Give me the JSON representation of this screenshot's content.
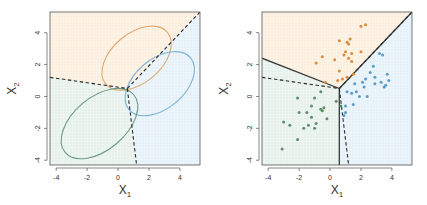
{
  "chart_data": [
    {
      "type": "scatter",
      "panel": "left",
      "title": "",
      "xlabel": "X1",
      "ylabel": "X2",
      "xlim": [
        -4.4,
        5.3
      ],
      "ylim": [
        -4.3,
        5.3
      ],
      "xticks": [
        -4,
        -2,
        0,
        2,
        4
      ],
      "yticks": [
        -4,
        -2,
        0,
        2,
        4
      ],
      "xtick_labels": [
        "-4",
        "-2",
        "0",
        "2",
        "4"
      ],
      "ytick_labels": [
        "-4",
        "-2",
        "0",
        "2",
        "4"
      ],
      "grid": true,
      "regions": [
        {
          "name": "orange-region",
          "color": "#fbeedd",
          "polygon": [
            [
              -4.4,
              1.2
            ],
            [
              0.6,
              0.5
            ],
            [
              5.3,
              5.3
            ],
            [
              -4.4,
              5.3
            ]
          ]
        },
        {
          "name": "blue-region",
          "color": "#e4f1f8",
          "polygon": [
            [
              0.6,
              0.5
            ],
            [
              5.3,
              5.3
            ],
            [
              5.3,
              -4.3
            ],
            [
              1.2,
              -4.3
            ]
          ]
        },
        {
          "name": "green-region",
          "color": "#e6f1ec",
          "polygon": [
            [
              -4.4,
              1.2
            ],
            [
              0.6,
              0.5
            ],
            [
              1.2,
              -4.3
            ],
            [
              -4.4,
              -4.3
            ]
          ]
        }
      ],
      "ellipses": [
        {
          "name": "orange-class",
          "color": "#e3a66b",
          "cx": 1.2,
          "cy": 2.4,
          "rx": 2.6,
          "ry": 1.55,
          "angle": -40
        },
        {
          "name": "blue-class",
          "color": "#7fb2d6",
          "cx": 2.7,
          "cy": 0.8,
          "rx": 2.6,
          "ry": 1.55,
          "angle": -40
        },
        {
          "name": "green-class",
          "color": "#6c9a7e",
          "cx": -1.2,
          "cy": -1.7,
          "rx": 2.9,
          "ry": 1.65,
          "angle": -40
        }
      ],
      "bayes_boundary_dashed": [
        [
          [
            -4.4,
            1.2
          ],
          [
            0.6,
            0.5
          ]
        ],
        [
          [
            0.6,
            0.5
          ],
          [
            5.3,
            5.3
          ]
        ],
        [
          [
            0.6,
            0.5
          ],
          [
            1.2,
            -4.3
          ]
        ]
      ]
    },
    {
      "type": "scatter",
      "panel": "right",
      "title": "",
      "xlabel": "X1",
      "ylabel": "X2",
      "xlim": [
        -4.4,
        5.3
      ],
      "ylim": [
        -4.3,
        5.3
      ],
      "xticks": [
        -4,
        -2,
        0,
        2,
        4
      ],
      "yticks": [
        -4,
        -2,
        0,
        2,
        4
      ],
      "xtick_labels": [
        "-4",
        "-2",
        "0",
        "2",
        "4"
      ],
      "ytick_labels": [
        "-4",
        "-2",
        "0",
        "2",
        "4"
      ],
      "grid": true,
      "regions": [
        {
          "name": "orange-region",
          "color": "#fbeedd",
          "polygon": [
            [
              -4.4,
              2.4
            ],
            [
              0.6,
              0.5
            ],
            [
              5.3,
              5.3
            ],
            [
              -4.4,
              5.3
            ]
          ]
        },
        {
          "name": "blue-region",
          "color": "#e4f1f8",
          "polygon": [
            [
              0.6,
              0.5
            ],
            [
              5.3,
              5.3
            ],
            [
              5.3,
              -4.3
            ],
            [
              0.6,
              -4.3
            ]
          ]
        },
        {
          "name": "green-region",
          "color": "#e6f1ec",
          "polygon": [
            [
              -4.4,
              2.4
            ],
            [
              0.6,
              0.5
            ],
            [
              0.6,
              -4.3
            ],
            [
              -4.4,
              -4.3
            ]
          ]
        }
      ],
      "lda_boundary_solid": [
        [
          [
            -4.4,
            2.4
          ],
          [
            0.6,
            0.5
          ]
        ],
        [
          [
            0.6,
            0.5
          ],
          [
            5.3,
            5.3
          ]
        ],
        [
          [
            0.6,
            0.5
          ],
          [
            0.6,
            -4.3
          ]
        ]
      ],
      "bayes_boundary_dashed": [
        [
          [
            -4.4,
            1.2
          ],
          [
            0.6,
            0.5
          ]
        ],
        [
          [
            0.6,
            0.5
          ],
          [
            5.3,
            5.3
          ]
        ],
        [
          [
            0.6,
            0.5
          ],
          [
            1.2,
            -4.3
          ]
        ]
      ],
      "series": [
        {
          "name": "orange",
          "color": "#e08a3c",
          "points": [
            [
              2.0,
              4.4
            ],
            [
              2.3,
              4.5
            ],
            [
              -0.9,
              2.1
            ],
            [
              -0.5,
              2.5
            ],
            [
              0.3,
              2.3
            ],
            [
              0.6,
              3.5
            ],
            [
              1.1,
              3.4
            ],
            [
              1.2,
              3.3
            ],
            [
              1.3,
              3.6
            ],
            [
              1.0,
              2.8
            ],
            [
              1.4,
              2.7
            ],
            [
              1.4,
              2.2
            ],
            [
              2.0,
              2.8
            ],
            [
              0.6,
              1.6
            ],
            [
              0.5,
              1.0
            ],
            [
              0.9,
              2.6
            ],
            [
              1.1,
              1.2
            ],
            [
              1.5,
              1.4
            ],
            [
              0.8,
              1.1
            ],
            [
              1.2,
              2.4
            ],
            [
              -0.3,
              0.9
            ]
          ]
        },
        {
          "name": "blue",
          "color": "#5b9bc8",
          "points": [
            [
              3.2,
              2.7
            ],
            [
              3.4,
              2.6
            ],
            [
              2.8,
              1.9
            ],
            [
              2.6,
              1.5
            ],
            [
              2.3,
              1.1
            ],
            [
              2.9,
              1.2
            ],
            [
              2.9,
              0.8
            ],
            [
              3.3,
              0.9
            ],
            [
              3.7,
              1.4
            ],
            [
              3.8,
              1.0
            ],
            [
              3.6,
              0.7
            ],
            [
              3.5,
              0.6
            ],
            [
              1.6,
              0.8
            ],
            [
              2.1,
              0.9
            ],
            [
              2.2,
              0.6
            ],
            [
              1.1,
              0.3
            ],
            [
              1.7,
              0.3
            ],
            [
              1.4,
              0.2
            ],
            [
              1.9,
              0.0
            ],
            [
              2.4,
              0.0
            ],
            [
              1.5,
              -0.5
            ],
            [
              1.0,
              -1.0
            ],
            [
              0.9,
              -1.2
            ],
            [
              1.0,
              -0.6
            ]
          ]
        },
        {
          "name": "green",
          "color": "#5e8f6a",
          "points": [
            [
              -0.6,
              0.3
            ],
            [
              -0.2,
              -1.4
            ],
            [
              -2.1,
              -0.1
            ],
            [
              -1.0,
              -0.1
            ],
            [
              -1.2,
              -0.6
            ],
            [
              -1.5,
              -1.0
            ],
            [
              -2.0,
              -1.0
            ],
            [
              -0.6,
              -0.8
            ],
            [
              -0.4,
              -0.7
            ],
            [
              -0.5,
              -0.9
            ],
            [
              -1.2,
              -1.3
            ],
            [
              -1.4,
              -1.8
            ],
            [
              -1.7,
              -2.0
            ],
            [
              -1.0,
              -2.0
            ],
            [
              -0.9,
              -1.7
            ],
            [
              -3.0,
              -1.6
            ],
            [
              -2.6,
              -1.8
            ],
            [
              -2.1,
              -2.7
            ],
            [
              -3.1,
              -3.3
            ],
            [
              0.4,
              -0.3
            ],
            [
              0.7,
              -0.6
            ]
          ]
        }
      ]
    }
  ]
}
